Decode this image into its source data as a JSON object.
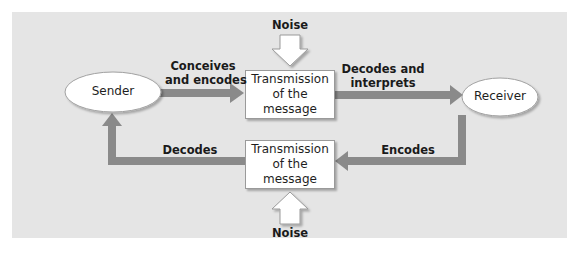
{
  "diagram": {
    "type": "communication-process-flow",
    "colors": {
      "background_panel": "#e5e5e5",
      "arrow": "#8a8a8a",
      "node_fill": "#ffffff",
      "noise_arrow_fill": "#ffffff"
    },
    "nodes": {
      "sender": {
        "label": "Sender",
        "shape": "ellipse"
      },
      "receiver": {
        "label": "Receiver",
        "shape": "ellipse"
      },
      "transmission_top": {
        "line1": "Transmission",
        "line2": "of the message",
        "shape": "box"
      },
      "transmission_bottom": {
        "line1": "Transmission",
        "line2": "of the message",
        "shape": "box"
      }
    },
    "edges": {
      "conceives": {
        "line1": "Conceives",
        "line2": "and encodes",
        "from": "Sender",
        "to": "Transmission (top)"
      },
      "decodes_interprets": {
        "line1": "Decodes and",
        "line2": "interprets",
        "from": "Transmission (top)",
        "to": "Receiver"
      },
      "encodes": {
        "label": "Encodes",
        "from": "Receiver",
        "to": "Transmission (bottom)"
      },
      "decodes": {
        "label": "Decodes",
        "from": "Transmission (bottom)",
        "to": "Sender"
      }
    },
    "noise": {
      "top": {
        "label": "Noise",
        "direction": "down"
      },
      "bottom": {
        "label": "Noise",
        "direction": "up"
      }
    }
  }
}
